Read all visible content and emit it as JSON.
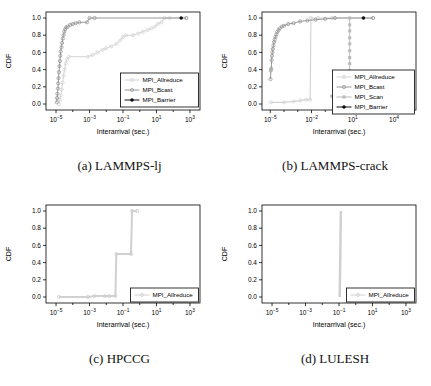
{
  "page": {
    "background": "#ffffff"
  },
  "chart_data": [
    {
      "type": "line",
      "caption": "(a) LAMMPS-lj",
      "xlabel": "Interarrival (sec.)",
      "ylabel": "CDF",
      "xscale": "log10",
      "xlim_exp": [
        -5.6,
        3.6
      ],
      "x_tick_exponents": [
        -5,
        -3,
        -1,
        1,
        3
      ],
      "y_ticks": [
        0.0,
        0.2,
        0.4,
        0.6,
        0.8,
        1.0
      ],
      "ylim": [
        0,
        1
      ],
      "grid": false,
      "legend": {
        "entries": [
          0,
          1,
          2
        ],
        "width": 78,
        "raise": 3,
        "position": "bottom-right"
      },
      "series": [
        {
          "name": "MPI_Allreduce",
          "color": "#d4d4d4",
          "marker": "circle-open",
          "lw": 1,
          "points": [
            [
              1.5e-05,
              0
            ],
            [
              1.7e-05,
              0.05
            ],
            [
              1.9e-05,
              0.1
            ],
            [
              2.2e-05,
              0.17
            ],
            [
              2.5e-05,
              0.25
            ],
            [
              2.8e-05,
              0.33
            ],
            [
              3.2e-05,
              0.4
            ],
            [
              3.8e-05,
              0.47
            ],
            [
              4.5e-05,
              0.52
            ],
            [
              6e-05,
              0.55
            ],
            [
              0.0008,
              0.55
            ],
            [
              0.0015,
              0.57
            ],
            [
              0.003,
              0.6
            ],
            [
              0.006,
              0.63
            ],
            [
              0.01,
              0.65
            ],
            [
              0.02,
              0.67
            ],
            [
              0.04,
              0.7
            ],
            [
              0.07,
              0.74
            ],
            [
              0.1,
              0.78
            ],
            [
              0.15,
              0.8
            ],
            [
              0.4,
              0.8
            ],
            [
              0.8,
              0.82
            ],
            [
              1.5,
              0.84
            ],
            [
              3,
              0.86
            ],
            [
              5,
              0.88
            ],
            [
              8,
              0.9
            ],
            [
              12,
              0.93
            ],
            [
              20,
              0.95
            ],
            [
              30,
              1.0
            ],
            [
              60,
              1.0
            ],
            [
              600,
              1.0
            ]
          ]
        },
        {
          "name": "MPI_Bcast",
          "color": "#989898",
          "marker": "circle-open",
          "lw": 1,
          "points": [
            [
              1.1e-05,
              0.02
            ],
            [
              1.15e-05,
              0.07
            ],
            [
              1.2e-05,
              0.12
            ],
            [
              1.3e-05,
              0.18
            ],
            [
              1.35e-05,
              0.24
            ],
            [
              1.4e-05,
              0.3
            ],
            [
              1.5e-05,
              0.37
            ],
            [
              1.6e-05,
              0.44
            ],
            [
              1.7e-05,
              0.5
            ],
            [
              1.8e-05,
              0.56
            ],
            [
              1.9e-05,
              0.61
            ],
            [
              2.1e-05,
              0.66
            ],
            [
              2.3e-05,
              0.71
            ],
            [
              2.5e-05,
              0.76
            ],
            [
              2.8e-05,
              0.8
            ],
            [
              3.1e-05,
              0.84
            ],
            [
              3.5e-05,
              0.87
            ],
            [
              4e-05,
              0.89
            ],
            [
              5e-05,
              0.9
            ],
            [
              7e-05,
              0.92
            ],
            [
              0.0001,
              0.93
            ],
            [
              0.00015,
              0.94
            ],
            [
              0.00025,
              0.95
            ],
            [
              0.0007,
              0.95
            ],
            [
              0.001,
              1.0
            ],
            [
              0.002,
              1.0
            ],
            [
              600,
              1.0
            ]
          ]
        },
        {
          "name": "MPI_Barrier",
          "color": "#111111",
          "marker": "dot",
          "lw": 1,
          "points": [
            [
              300,
              1.0
            ]
          ]
        }
      ]
    },
    {
      "type": "line",
      "caption": "(b) LAMMPS-crack",
      "xlabel": "Interarrival (sec.)",
      "ylabel": "CDF",
      "xscale": "log10",
      "xlim_exp": [
        -5.6,
        5.6
      ],
      "x_tick_exponents": [
        -5,
        -2,
        1,
        4
      ],
      "y_ticks": [
        0.0,
        0.2,
        0.4,
        0.6,
        0.8,
        1.0
      ],
      "ylim": [
        0,
        1
      ],
      "grid": false,
      "legend": {
        "entries": [
          0,
          1,
          2,
          3
        ],
        "width": 82,
        "raise": -4,
        "position": "bottom-right"
      },
      "series": [
        {
          "name": "MPI_Allreduce",
          "color": "#d4d4d4",
          "marker": "circle-open",
          "lw": 1.2,
          "points": [
            [
              1.1e-05,
              0.02
            ],
            [
              0.0001,
              0.02
            ],
            [
              0.0005,
              0.03
            ],
            [
              0.0015,
              0.04
            ],
            [
              0.004,
              0.05
            ],
            [
              0.008,
              0.05
            ],
            [
              0.009,
              1.0
            ],
            [
              0.03,
              1.0
            ],
            [
              0.3,
              1.0
            ],
            [
              300,
              1.0
            ]
          ]
        },
        {
          "name": "MPI_Bcast",
          "color": "#989898",
          "marker": "circle-open",
          "lw": 1,
          "points": [
            [
              1.05e-05,
              0.29
            ],
            [
              1.1e-05,
              0.39
            ],
            [
              1.2e-05,
              0.41
            ],
            [
              1.25e-05,
              0.51
            ],
            [
              1.35e-05,
              0.56
            ],
            [
              1.45e-05,
              0.6
            ],
            [
              1.55e-05,
              0.64
            ],
            [
              1.7e-05,
              0.68
            ],
            [
              1.9e-05,
              0.72
            ],
            [
              2.1e-05,
              0.75
            ],
            [
              2.4e-05,
              0.78
            ],
            [
              2.8e-05,
              0.81
            ],
            [
              3.3e-05,
              0.84
            ],
            [
              4e-05,
              0.86
            ],
            [
              5e-05,
              0.88
            ],
            [
              7e-05,
              0.9
            ],
            [
              0.0001,
              0.91
            ],
            [
              0.0002,
              0.93
            ],
            [
              0.0005,
              0.94
            ],
            [
              0.0015,
              0.96
            ],
            [
              0.005,
              0.97
            ],
            [
              0.02,
              0.98
            ],
            [
              0.1,
              0.99
            ],
            [
              0.5,
              1.0
            ],
            [
              300,
              1.0
            ]
          ]
        },
        {
          "name": "MPI_Scan",
          "color": "#b8b8b8",
          "marker": "square",
          "lw": 0.9,
          "points": [
            [
              0.3,
              0.09
            ],
            [
              6,
              0.09
            ],
            [
              6,
              0.16
            ],
            [
              6,
              0.24
            ],
            [
              6,
              0.31
            ],
            [
              6,
              0.39
            ],
            [
              6,
              0.47
            ],
            [
              6,
              0.54
            ],
            [
              6,
              0.62
            ],
            [
              6,
              0.7
            ],
            [
              6,
              0.77
            ],
            [
              6,
              0.85
            ],
            [
              6,
              0.92
            ],
            [
              6,
              1.0
            ]
          ]
        },
        {
          "name": "MPI_Barrier",
          "color": "#111111",
          "marker": "dot",
          "lw": 1,
          "points": [
            [
              60,
              1.0
            ]
          ]
        }
      ]
    },
    {
      "type": "line",
      "caption": "(c) HPCCG",
      "xlabel": "Interarrival (sec.)",
      "ylabel": "CDF",
      "xscale": "log10",
      "xlim_exp": [
        -5.6,
        3.6
      ],
      "x_tick_exponents": [
        -5,
        -3,
        -1,
        1,
        3
      ],
      "y_ticks": [
        0.0,
        0.2,
        0.4,
        0.6,
        0.8,
        1.0
      ],
      "ylim": [
        0,
        1
      ],
      "grid": false,
      "legend": {
        "entries": [
          0
        ],
        "width": 68,
        "raise": 1,
        "position": "bottom-right"
      },
      "series": [
        {
          "name": "MPI_Allreduce",
          "color": "#d0d0d0",
          "marker": "circle-open",
          "lw": 2,
          "points": [
            [
              1.5e-05,
              0
            ],
            [
              0.0008,
              0
            ],
            [
              0.002,
              0.01
            ],
            [
              0.008,
              0.01
            ],
            [
              0.015,
              0.01
            ],
            [
              0.035,
              0.01
            ],
            [
              0.04,
              0.5
            ],
            [
              0.3,
              0.5
            ],
            [
              0.35,
              1.0
            ],
            [
              0.7,
              1.0
            ]
          ]
        }
      ]
    },
    {
      "type": "line",
      "caption": "(d) LULESH",
      "xlabel": "Interarrival (sec.)",
      "ylabel": "CDF",
      "xscale": "log10",
      "xlim_exp": [
        -5.6,
        3.6
      ],
      "x_tick_exponents": [
        -5,
        -3,
        -1,
        1,
        3
      ],
      "y_ticks": [
        0.0,
        0.2,
        0.4,
        0.6,
        0.8,
        1.0
      ],
      "ylim": [
        0,
        1
      ],
      "grid": false,
      "legend": {
        "entries": [
          0
        ],
        "width": 68,
        "raise": 1,
        "position": "bottom-right"
      },
      "series": [
        {
          "name": "MPI_Allreduce",
          "color": "#d0d0d0",
          "marker": "none",
          "lw": 2.5,
          "points": [
            [
              0.11,
              0
            ],
            [
              0.12,
              0.5
            ],
            [
              0.13,
              1.0
            ]
          ]
        }
      ]
    }
  ]
}
